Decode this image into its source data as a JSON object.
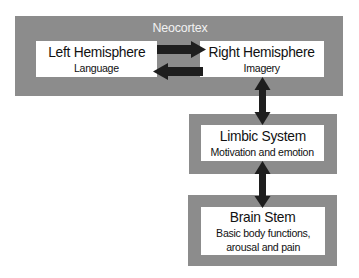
{
  "diagram": {
    "neocortex": {
      "label": "Neocortex",
      "left": {
        "title": "Left Hemisphere",
        "subtitle": "Language"
      },
      "right": {
        "title": "Right Hemisphere",
        "subtitle": "Imagery"
      }
    },
    "limbic": {
      "title": "Limbic System",
      "subtitle": "Motivation and emotion"
    },
    "brainstem": {
      "title": "Brain Stem",
      "subtitle_line1": "Basic body functions,",
      "subtitle_line2": "arousal and pain"
    },
    "arrows": [
      {
        "from": "Left Hemisphere",
        "to": "Right Hemisphere",
        "direction": "right"
      },
      {
        "from": "Right Hemisphere",
        "to": "Left Hemisphere",
        "direction": "left"
      },
      {
        "between": [
          "Right Hemisphere",
          "Limbic System"
        ],
        "direction": "bidirectional"
      },
      {
        "between": [
          "Limbic System",
          "Brain Stem"
        ],
        "direction": "bidirectional"
      }
    ],
    "colors": {
      "box_fill": "#8c8c8c",
      "inner_fill": "#ffffff",
      "arrow": "#1e1e1e",
      "label_text": "#f2f2f2"
    }
  }
}
